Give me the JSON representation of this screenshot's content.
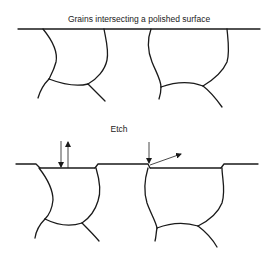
{
  "diagram": {
    "top_panel": {
      "title": "Grains intersecting a polished surface"
    },
    "bottom_panel": {
      "title": "Etch"
    },
    "colors": {
      "line": "#1a1a1a",
      "background": "#ffffff"
    }
  }
}
